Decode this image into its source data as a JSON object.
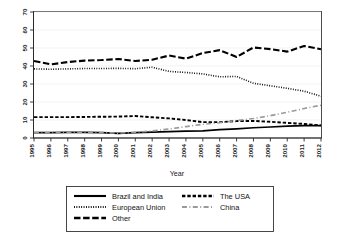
{
  "chart_data": {
    "type": "line",
    "title": "",
    "xlabel": "Year",
    "ylabel": "",
    "xlim": [
      1995,
      2012
    ],
    "ylim": [
      0,
      70
    ],
    "yticks": [
      0,
      10,
      20,
      30,
      40,
      50,
      60,
      70
    ],
    "grid": true,
    "legend_position": "below",
    "x": [
      1995,
      1996,
      1997,
      1998,
      1999,
      2000,
      2001,
      2002,
      2003,
      2004,
      2005,
      2006,
      2007,
      2008,
      2009,
      2010,
      2011,
      2012
    ],
    "categories": [
      "1995",
      "1996",
      "1997",
      "1998",
      "1999",
      "2000",
      "2001",
      "2002",
      "2003",
      "2004",
      "2005",
      "2006",
      "2007",
      "2008",
      "2009",
      "2010",
      "2011",
      "2012"
    ],
    "series": [
      {
        "name": "Brazil and India",
        "style": "solid",
        "color": "#000000",
        "values": [
          3.0,
          3.0,
          3.1,
          3.1,
          3.0,
          2.6,
          3.0,
          3.3,
          3.5,
          3.8,
          4.0,
          4.6,
          5.1,
          5.7,
          6.1,
          6.6,
          6.9,
          6.9
        ]
      },
      {
        "name": "European Union",
        "style": "dotted",
        "color": "#000000",
        "values": [
          38.4,
          38.2,
          38.4,
          38.6,
          38.6,
          38.7,
          38.5,
          39.3,
          37.0,
          36.4,
          35.6,
          34.0,
          34.2,
          30.4,
          29.0,
          27.6,
          26.0,
          23.2
        ]
      },
      {
        "name": "Other",
        "style": "longdash",
        "color": "#000000",
        "values": [
          42.8,
          40.9,
          42.2,
          43.0,
          43.3,
          43.9,
          42.8,
          43.5,
          45.8,
          44.1,
          47.2,
          48.8,
          45.0,
          50.3,
          49.4,
          48.0,
          51.1,
          49.3
        ]
      },
      {
        "name": "The USA",
        "style": "dash",
        "color": "#000000",
        "values": [
          11.6,
          11.6,
          11.6,
          11.7,
          11.8,
          11.9,
          12.2,
          11.5,
          10.9,
          10.0,
          8.8,
          8.8,
          9.4,
          9.5,
          9.0,
          8.4,
          7.8,
          7.0
        ]
      },
      {
        "name": "China",
        "style": "dashdot",
        "color": "#9a9a9a",
        "values": [
          3.0,
          3.0,
          3.1,
          3.1,
          3.0,
          2.7,
          3.2,
          3.9,
          5.0,
          6.3,
          7.6,
          8.5,
          9.7,
          10.8,
          12.4,
          14.3,
          16.4,
          18.2
        ]
      }
    ]
  },
  "axis": {
    "x_title": "Year",
    "y_ticks": [
      "0",
      "10",
      "20",
      "30",
      "40",
      "50",
      "60",
      "70"
    ]
  },
  "legend": {
    "entries": [
      {
        "label": "Brazil and India",
        "style": "solid"
      },
      {
        "label": "The USA",
        "style": "dash"
      },
      {
        "label": "European Union",
        "style": "dotted"
      },
      {
        "label": "China",
        "style": "dashdot"
      },
      {
        "label": "Other",
        "style": "longdash"
      }
    ]
  }
}
